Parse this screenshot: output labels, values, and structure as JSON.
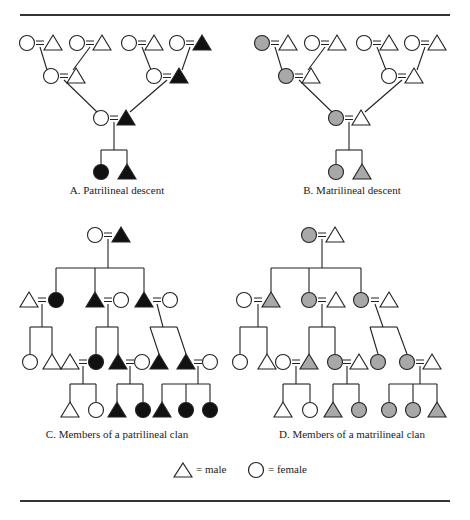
{
  "colors": {
    "black": "#111111",
    "gray": "#a8a8a8",
    "white": "#ffffff",
    "stroke": "#222222"
  },
  "rules": [
    {
      "y": 14
    },
    {
      "y": 500
    }
  ],
  "captions": [
    {
      "id": "a",
      "text": "A.  Patrilineal descent",
      "x": 117,
      "y": 190
    },
    {
      "id": "b",
      "text": "B.  Matrilineal descent",
      "x": 352,
      "y": 190
    },
    {
      "id": "c",
      "text": "C.  Members of a patrilineal clan",
      "x": 117,
      "y": 434
    },
    {
      "id": "d",
      "text": "D.  Members of a matrilineal clan",
      "x": 352,
      "y": 434
    }
  ],
  "legend": {
    "male": {
      "symbol": "triangle",
      "label": "= male",
      "x": 178,
      "y": 470
    },
    "female": {
      "symbol": "circle",
      "label": "= female",
      "x": 257,
      "y": 470
    }
  },
  "panels": [
    {
      "id": "A",
      "nodes": [
        {
          "s": "c",
          "f": "w",
          "x": 27,
          "y": 43
        },
        {
          "s": "t",
          "f": "w",
          "x": 53,
          "y": 43
        },
        {
          "s": "c",
          "f": "w",
          "x": 77,
          "y": 43
        },
        {
          "s": "t",
          "f": "w",
          "x": 102,
          "y": 43
        },
        {
          "s": "c",
          "f": "w",
          "x": 129,
          "y": 43
        },
        {
          "s": "t",
          "f": "w",
          "x": 154,
          "y": 43
        },
        {
          "s": "c",
          "f": "w",
          "x": 177,
          "y": 43
        },
        {
          "s": "t",
          "f": "b",
          "x": 202,
          "y": 43
        },
        {
          "s": "c",
          "f": "w",
          "x": 51,
          "y": 76
        },
        {
          "s": "t",
          "f": "w",
          "x": 76,
          "y": 76
        },
        {
          "s": "c",
          "f": "w",
          "x": 154,
          "y": 76
        },
        {
          "s": "t",
          "f": "b",
          "x": 179,
          "y": 76
        },
        {
          "s": "c",
          "f": "w",
          "x": 101,
          "y": 118
        },
        {
          "s": "t",
          "f": "b",
          "x": 126,
          "y": 118
        },
        {
          "s": "c",
          "f": "b",
          "x": 101,
          "y": 172
        },
        {
          "s": "t",
          "f": "b",
          "x": 127,
          "y": 172
        }
      ],
      "marriages": [
        [
          40,
          43
        ],
        [
          90,
          43
        ],
        [
          142,
          43
        ],
        [
          190,
          43
        ],
        [
          64,
          76
        ],
        [
          167,
          76
        ],
        [
          114,
          118
        ]
      ],
      "lines": [
        [
          40,
          47,
          47,
          70
        ],
        [
          90,
          47,
          73,
          70
        ],
        [
          142,
          47,
          151,
          70
        ],
        [
          190,
          47,
          182,
          70
        ],
        [
          64,
          80,
          97,
          112
        ],
        [
          167,
          80,
          130,
          112
        ],
        [
          114,
          122,
          114,
          150
        ],
        [
          101,
          150,
          127,
          150
        ],
        [
          101,
          150,
          101,
          164
        ],
        [
          127,
          150,
          127,
          164
        ]
      ]
    },
    {
      "id": "B",
      "nodes": [
        {
          "s": "c",
          "f": "g",
          "x": 262,
          "y": 43
        },
        {
          "s": "t",
          "f": "w",
          "x": 288,
          "y": 43
        },
        {
          "s": "c",
          "f": "w",
          "x": 312,
          "y": 43
        },
        {
          "s": "t",
          "f": "w",
          "x": 337,
          "y": 43
        },
        {
          "s": "c",
          "f": "w",
          "x": 364,
          "y": 43
        },
        {
          "s": "t",
          "f": "w",
          "x": 389,
          "y": 43
        },
        {
          "s": "c",
          "f": "w",
          "x": 412,
          "y": 43
        },
        {
          "s": "t",
          "f": "w",
          "x": 437,
          "y": 43
        },
        {
          "s": "c",
          "f": "g",
          "x": 286,
          "y": 76
        },
        {
          "s": "t",
          "f": "w",
          "x": 311,
          "y": 76
        },
        {
          "s": "c",
          "f": "w",
          "x": 389,
          "y": 76
        },
        {
          "s": "t",
          "f": "w",
          "x": 414,
          "y": 76
        },
        {
          "s": "c",
          "f": "g",
          "x": 336,
          "y": 118
        },
        {
          "s": "t",
          "f": "w",
          "x": 361,
          "y": 118
        },
        {
          "s": "c",
          "f": "g",
          "x": 336,
          "y": 172
        },
        {
          "s": "t",
          "f": "g",
          "x": 362,
          "y": 172
        }
      ],
      "marriages": [
        [
          275,
          43
        ],
        [
          325,
          43
        ],
        [
          377,
          43
        ],
        [
          425,
          43
        ],
        [
          299,
          76
        ],
        [
          402,
          76
        ],
        [
          349,
          118
        ]
      ],
      "lines": [
        [
          275,
          47,
          282,
          70
        ],
        [
          325,
          47,
          308,
          70
        ],
        [
          377,
          47,
          386,
          70
        ],
        [
          425,
          47,
          417,
          70
        ],
        [
          299,
          80,
          332,
          112
        ],
        [
          402,
          80,
          365,
          112
        ],
        [
          349,
          122,
          349,
          150
        ],
        [
          336,
          150,
          362,
          150
        ],
        [
          336,
          150,
          336,
          164
        ],
        [
          362,
          150,
          362,
          164
        ]
      ]
    },
    {
      "id": "C",
      "nodes": [
        {
          "s": "c",
          "f": "w",
          "x": 95,
          "y": 235
        },
        {
          "s": "t",
          "f": "b",
          "x": 121,
          "y": 235
        },
        {
          "s": "t",
          "f": "w",
          "x": 29,
          "y": 300
        },
        {
          "s": "c",
          "f": "b",
          "x": 56,
          "y": 300
        },
        {
          "s": "t",
          "f": "b",
          "x": 95,
          "y": 300
        },
        {
          "s": "c",
          "f": "w",
          "x": 121,
          "y": 300
        },
        {
          "s": "t",
          "f": "b",
          "x": 144,
          "y": 300
        },
        {
          "s": "c",
          "f": "w",
          "x": 170,
          "y": 300
        },
        {
          "s": "c",
          "f": "w",
          "x": 30,
          "y": 362
        },
        {
          "s": "t",
          "f": "w",
          "x": 52,
          "y": 362
        },
        {
          "s": "t",
          "f": "w",
          "x": 70,
          "y": 362
        },
        {
          "s": "c",
          "f": "b",
          "x": 96,
          "y": 362
        },
        {
          "s": "t",
          "f": "b",
          "x": 118,
          "y": 362
        },
        {
          "s": "c",
          "f": "w",
          "x": 142,
          "y": 362
        },
        {
          "s": "t",
          "f": "b",
          "x": 159,
          "y": 362
        },
        {
          "s": "t",
          "f": "b",
          "x": 186,
          "y": 362
        },
        {
          "s": "c",
          "f": "w",
          "x": 210,
          "y": 362
        },
        {
          "s": "t",
          "f": "w",
          "x": 70,
          "y": 410
        },
        {
          "s": "c",
          "f": "w",
          "x": 96,
          "y": 410
        },
        {
          "s": "t",
          "f": "b",
          "x": 117,
          "y": 410
        },
        {
          "s": "c",
          "f": "b",
          "x": 143,
          "y": 410
        },
        {
          "s": "t",
          "f": "b",
          "x": 162,
          "y": 410
        },
        {
          "s": "c",
          "f": "b",
          "x": 186,
          "y": 410
        },
        {
          "s": "c",
          "f": "b",
          "x": 210,
          "y": 410
        }
      ],
      "marriages": [
        [
          108,
          235
        ],
        [
          42,
          300
        ],
        [
          108,
          300
        ],
        [
          157,
          300
        ],
        [
          83,
          362
        ],
        [
          130,
          362
        ],
        [
          198,
          362
        ]
      ],
      "lines": [
        [
          108,
          239,
          108,
          268
        ],
        [
          56,
          268,
          144,
          268
        ],
        [
          56,
          268,
          56,
          292
        ],
        [
          95,
          268,
          95,
          292
        ],
        [
          144,
          268,
          144,
          292
        ],
        [
          42,
          304,
          42,
          327
        ],
        [
          30,
          327,
          52,
          327
        ],
        [
          30,
          327,
          30,
          354
        ],
        [
          52,
          327,
          52,
          354
        ],
        [
          108,
          304,
          108,
          327
        ],
        [
          96,
          327,
          118,
          327
        ],
        [
          96,
          327,
          96,
          354
        ],
        [
          118,
          327,
          118,
          354
        ],
        [
          157,
          304,
          163,
          327
        ],
        [
          150,
          327,
          177,
          327
        ],
        [
          150,
          327,
          159,
          354
        ],
        [
          177,
          327,
          186,
          354
        ],
        [
          83,
          366,
          83,
          384
        ],
        [
          70,
          384,
          96,
          384
        ],
        [
          70,
          384,
          70,
          402
        ],
        [
          96,
          384,
          96,
          402
        ],
        [
          130,
          366,
          130,
          384
        ],
        [
          117,
          384,
          143,
          384
        ],
        [
          117,
          384,
          117,
          402
        ],
        [
          143,
          384,
          143,
          402
        ],
        [
          198,
          366,
          198,
          384
        ],
        [
          162,
          384,
          210,
          384
        ],
        [
          162,
          384,
          162,
          402
        ],
        [
          186,
          384,
          186,
          402
        ],
        [
          210,
          384,
          210,
          402
        ]
      ]
    },
    {
      "id": "D",
      "nodes": [
        {
          "s": "c",
          "f": "g",
          "x": 309,
          "y": 235
        },
        {
          "s": "t",
          "f": "w",
          "x": 335,
          "y": 235
        },
        {
          "s": "c",
          "f": "w",
          "x": 244,
          "y": 300
        },
        {
          "s": "t",
          "f": "g",
          "x": 271,
          "y": 300
        },
        {
          "s": "c",
          "f": "g",
          "x": 309,
          "y": 300
        },
        {
          "s": "t",
          "f": "w",
          "x": 336,
          "y": 300
        },
        {
          "s": "c",
          "f": "g",
          "x": 361,
          "y": 300
        },
        {
          "s": "t",
          "f": "w",
          "x": 389,
          "y": 300
        },
        {
          "s": "c",
          "f": "w",
          "x": 240,
          "y": 362
        },
        {
          "s": "t",
          "f": "w",
          "x": 267,
          "y": 362
        },
        {
          "s": "c",
          "f": "w",
          "x": 283,
          "y": 362
        },
        {
          "s": "t",
          "f": "g",
          "x": 309,
          "y": 362
        },
        {
          "s": "c",
          "f": "g",
          "x": 335,
          "y": 362
        },
        {
          "s": "t",
          "f": "w",
          "x": 359,
          "y": 362
        },
        {
          "s": "c",
          "f": "g",
          "x": 378,
          "y": 362
        },
        {
          "s": "c",
          "f": "g",
          "x": 407,
          "y": 362
        },
        {
          "s": "t",
          "f": "w",
          "x": 432,
          "y": 362
        },
        {
          "s": "t",
          "f": "w",
          "x": 283,
          "y": 410
        },
        {
          "s": "c",
          "f": "w",
          "x": 310,
          "y": 410
        },
        {
          "s": "t",
          "f": "g",
          "x": 333,
          "y": 410
        },
        {
          "s": "c",
          "f": "g",
          "x": 359,
          "y": 410
        },
        {
          "s": "c",
          "f": "g",
          "x": 389,
          "y": 410
        },
        {
          "s": "c",
          "f": "g",
          "x": 413,
          "y": 410
        },
        {
          "s": "t",
          "f": "g",
          "x": 437,
          "y": 410
        }
      ],
      "marriages": [
        [
          322,
          235
        ],
        [
          258,
          300
        ],
        [
          322,
          300
        ],
        [
          375,
          300
        ],
        [
          296,
          362
        ],
        [
          347,
          362
        ],
        [
          420,
          362
        ]
      ],
      "lines": [
        [
          322,
          239,
          322,
          268
        ],
        [
          271,
          268,
          361,
          268
        ],
        [
          271,
          268,
          271,
          292
        ],
        [
          309,
          268,
          309,
          292
        ],
        [
          361,
          268,
          361,
          292
        ],
        [
          258,
          304,
          258,
          327
        ],
        [
          240,
          327,
          267,
          327
        ],
        [
          240,
          327,
          240,
          354
        ],
        [
          267,
          327,
          267,
          354
        ],
        [
          322,
          304,
          322,
          327
        ],
        [
          309,
          327,
          335,
          327
        ],
        [
          309,
          327,
          309,
          354
        ],
        [
          335,
          327,
          335,
          354
        ],
        [
          375,
          304,
          383,
          327
        ],
        [
          370,
          327,
          397,
          327
        ],
        [
          370,
          327,
          378,
          354
        ],
        [
          397,
          327,
          407,
          354
        ],
        [
          296,
          366,
          296,
          384
        ],
        [
          283,
          384,
          310,
          384
        ],
        [
          283,
          384,
          283,
          402
        ],
        [
          310,
          384,
          310,
          402
        ],
        [
          347,
          366,
          347,
          384
        ],
        [
          333,
          384,
          359,
          384
        ],
        [
          333,
          384,
          333,
          402
        ],
        [
          359,
          384,
          359,
          402
        ],
        [
          420,
          366,
          420,
          384
        ],
        [
          389,
          384,
          437,
          384
        ],
        [
          389,
          384,
          389,
          402
        ],
        [
          413,
          384,
          413,
          402
        ],
        [
          437,
          384,
          437,
          402
        ]
      ]
    }
  ]
}
